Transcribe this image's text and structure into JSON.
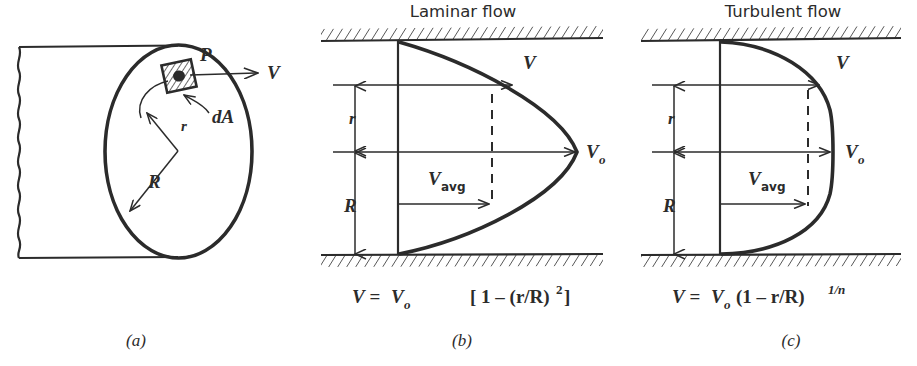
{
  "figure": {
    "background_color": "#ffffff",
    "ink_color": "#2b2b2b",
    "width": 917,
    "height": 366
  },
  "panels": [
    {
      "id": "a",
      "caption": "(a)",
      "title": "",
      "labels": {
        "point_p": "P",
        "velocity": "V",
        "element_area": "dA",
        "radius_small": "r",
        "radius_large": "R"
      }
    },
    {
      "id": "b",
      "caption": "(b)",
      "title": "Laminar flow",
      "labels": {
        "velocity": "V",
        "velocity_center": "V",
        "velocity_center_sub": "o",
        "velocity_avg": "V",
        "velocity_avg_sub": "avg",
        "radius_small": "r",
        "radius_large": "R"
      },
      "equation": {
        "lhs": "V",
        "eq": "=",
        "rhs_v": "V",
        "rhs_sub": "o",
        "rhs_rest": "[ 1 – (r/R)",
        "rhs_exp": "2",
        "rhs_close": " ]",
        "plain": "V = Vo [ 1 – (r/R)² ]"
      }
    },
    {
      "id": "c",
      "caption": "(c)",
      "title": "Turbulent flow",
      "labels": {
        "velocity": "V",
        "velocity_center": "V",
        "velocity_center_sub": "o",
        "velocity_avg": "V",
        "velocity_avg_sub": "avg",
        "radius_small": "r",
        "radius_large": "R"
      },
      "equation": {
        "lhs": "V",
        "eq": "=",
        "rhs_v": "V",
        "rhs_sub": "o",
        "rhs_rest": "(1 – r/R)",
        "rhs_exp": "1/n",
        "rhs_close": "",
        "plain": "V = Vo (1 – r/R)^(1/n)"
      }
    }
  ]
}
